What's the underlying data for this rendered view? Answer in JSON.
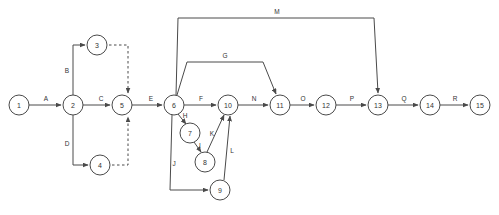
{
  "diagram": {
    "type": "activity-on-arrow-network",
    "canvas": {
      "width": 499,
      "height": 215,
      "background": "#ffffff"
    },
    "style": {
      "node_fill": "#ffffff",
      "node_stroke": "#4a4a4a",
      "edge_stroke": "#4a4a4a",
      "text_color": "#333333",
      "node_radius": 10
    },
    "nodes": [
      {
        "id": "1",
        "label": "1",
        "x": 19,
        "y": 105
      },
      {
        "id": "2",
        "label": "2",
        "x": 73,
        "y": 105
      },
      {
        "id": "3",
        "label": "3",
        "x": 97,
        "y": 45
      },
      {
        "id": "4",
        "label": "4",
        "x": 100,
        "y": 165
      },
      {
        "id": "5",
        "label": "5",
        "x": 122,
        "y": 105
      },
      {
        "id": "6",
        "label": "6",
        "x": 174,
        "y": 105
      },
      {
        "id": "7",
        "label": "7",
        "x": 190,
        "y": 133
      },
      {
        "id": "8",
        "label": "8",
        "x": 205,
        "y": 162
      },
      {
        "id": "9",
        "label": "9",
        "x": 220,
        "y": 190
      },
      {
        "id": "10",
        "label": "10",
        "x": 228,
        "y": 105
      },
      {
        "id": "11",
        "label": "11",
        "x": 280,
        "y": 105
      },
      {
        "id": "12",
        "label": "12",
        "x": 326,
        "y": 105
      },
      {
        "id": "13",
        "label": "13",
        "x": 378,
        "y": 105
      },
      {
        "id": "14",
        "label": "14",
        "x": 430,
        "y": 105
      },
      {
        "id": "15",
        "label": "15",
        "x": 480,
        "y": 105
      }
    ],
    "edges": [
      {
        "id": "A",
        "label": "A",
        "from": "1",
        "to": "2",
        "style": "solid",
        "label_x": 46,
        "label_y": 98,
        "path": "M 29 105 L 61 105"
      },
      {
        "id": "B",
        "label": "B",
        "from": "2",
        "to": "3",
        "style": "solid",
        "label_x": 67,
        "label_y": 70,
        "path": "M 73 95 L 73 45 L 85 45"
      },
      {
        "id": "C",
        "label": "C",
        "from": "2",
        "to": "5",
        "style": "solid",
        "label_x": 101,
        "label_y": 98,
        "path": "M 83 105 L 110 105"
      },
      {
        "id": "D",
        "label": "D",
        "from": "2",
        "to": "4",
        "style": "solid",
        "label_x": 67,
        "label_y": 143,
        "path": "M 73 115 L 73 165 L 88 165"
      },
      {
        "id": "D3",
        "label": "",
        "from": "3",
        "to": "5",
        "style": "dashed",
        "label_x": 0,
        "label_y": 0,
        "path": "M 109 45 L 128 45 L 128 93"
      },
      {
        "id": "D4",
        "label": "",
        "from": "4",
        "to": "5",
        "style": "dashed",
        "label_x": 0,
        "label_y": 0,
        "path": "M 112 165 L 128 165 L 128 117"
      },
      {
        "id": "E",
        "label": "E",
        "from": "5",
        "to": "6",
        "style": "solid",
        "label_x": 151,
        "label_y": 98,
        "path": "M 132 105 L 162 105"
      },
      {
        "id": "F",
        "label": "F",
        "from": "6",
        "to": "10",
        "style": "solid",
        "label_x": 201,
        "label_y": 98,
        "path": "M 184 105 L 216 105"
      },
      {
        "id": "G",
        "label": "G",
        "from": "6",
        "to": "11",
        "style": "solid",
        "label_x": 225,
        "label_y": 55,
        "path": "M 177 95 L 187 62 L 263 62 L 276 94"
      },
      {
        "id": "H",
        "label": "H",
        "from": "6",
        "to": "7",
        "style": "solid",
        "label_x": 185,
        "label_y": 115,
        "path": "M 178 114 L 186 124"
      },
      {
        "id": "I",
        "label": "I",
        "from": "7",
        "to": "8",
        "style": "solid",
        "label_x": 200,
        "label_y": 145,
        "path": "M 194 142 L 201 152"
      },
      {
        "id": "J",
        "label": "J",
        "from": "6",
        "to": "9",
        "style": "solid",
        "label_x": 174,
        "label_y": 163,
        "path": "M 172 115 L 170 190 L 208 190"
      },
      {
        "id": "K",
        "label": "K",
        "from": "8",
        "to": "10",
        "style": "solid",
        "label_x": 212,
        "label_y": 133,
        "path": "M 207 152 L 224 115"
      },
      {
        "id": "L",
        "label": "L",
        "from": "9",
        "to": "10",
        "style": "solid",
        "label_x": 232,
        "label_y": 150,
        "path": "M 224 180 L 230 116"
      },
      {
        "id": "N",
        "label": "N",
        "from": "10",
        "to": "11",
        "style": "solid",
        "label_x": 254,
        "label_y": 98,
        "path": "M 238 105 L 268 105"
      },
      {
        "id": "M",
        "label": "M",
        "from": "6",
        "to": "13",
        "style": "solid",
        "label_x": 277,
        "label_y": 11,
        "path": "M 176 95 L 178 18 L 374 18 L 378 93"
      },
      {
        "id": "O",
        "label": "O",
        "from": "11",
        "to": "12",
        "style": "solid",
        "label_x": 303,
        "label_y": 98,
        "path": "M 290 105 L 314 105"
      },
      {
        "id": "P",
        "label": "P",
        "from": "12",
        "to": "13",
        "style": "solid",
        "label_x": 352,
        "label_y": 98,
        "path": "M 336 105 L 366 105"
      },
      {
        "id": "Q",
        "label": "Q",
        "from": "13",
        "to": "14",
        "style": "solid",
        "label_x": 404,
        "label_y": 98,
        "path": "M 388 105 L 418 105"
      },
      {
        "id": "R",
        "label": "R",
        "from": "14",
        "to": "15",
        "style": "solid",
        "label_x": 455,
        "label_y": 98,
        "path": "M 440 105 L 468 105"
      }
    ]
  }
}
